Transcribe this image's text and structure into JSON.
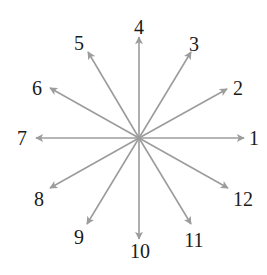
{
  "diagram": {
    "title": "",
    "center": {
      "x": 139,
      "y": 138
    },
    "arrow_color": "#9c9c9c",
    "label_color": "#1a1a1a",
    "arrows": [
      {
        "label": "1",
        "tip": [
          244,
          138
        ],
        "label_pos": [
          254,
          145
        ]
      },
      {
        "label": "2",
        "tip": [
          227,
          89
        ],
        "label_pos": [
          238,
          95
        ]
      },
      {
        "label": "3",
        "tip": [
          191,
          52
        ],
        "label_pos": [
          194,
          51
        ]
      },
      {
        "label": "4",
        "tip": [
          139,
          37
        ],
        "label_pos": [
          139,
          34
        ]
      },
      {
        "label": "5",
        "tip": [
          88,
          52
        ],
        "label_pos": [
          79,
          50
        ]
      },
      {
        "label": "6",
        "tip": [
          50,
          88
        ],
        "label_pos": [
          37,
          95
        ]
      },
      {
        "label": "7",
        "tip": [
          36,
          138
        ],
        "label_pos": [
          22,
          145
        ]
      },
      {
        "label": "8",
        "tip": [
          50,
          188
        ],
        "label_pos": [
          39,
          206
        ]
      },
      {
        "label": "9",
        "tip": [
          87,
          224
        ],
        "label_pos": [
          79,
          244
        ]
      },
      {
        "label": "10",
        "tip": [
          139,
          239
        ],
        "label_pos": [
          140,
          258
        ]
      },
      {
        "label": "11",
        "tip": [
          191,
          224
        ],
        "label_pos": [
          194,
          247
        ]
      },
      {
        "label": "12",
        "tip": [
          228,
          188
        ],
        "label_pos": [
          243,
          206
        ]
      }
    ]
  }
}
